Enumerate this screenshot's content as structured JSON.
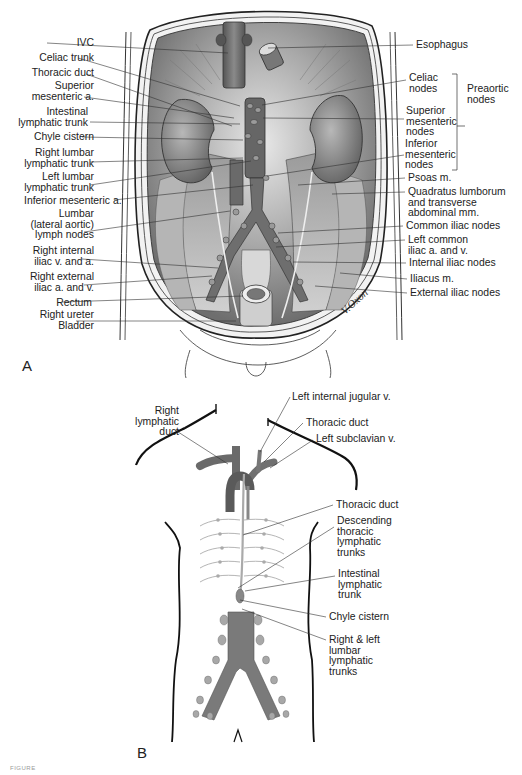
{
  "figure": {
    "panel_a": {
      "letter": "A",
      "x": 22,
      "y": 357
    },
    "panel_b": {
      "letter": "B",
      "x": 137,
      "y": 744
    },
    "signature": "V.Oxon",
    "caption": "FIGURE"
  },
  "panel_a_labels_left": [
    {
      "id": "ivc",
      "text": "IVC",
      "x": 24,
      "y": 38,
      "lx": 47,
      "ly": 43,
      "tx": 228,
      "ty": 53
    },
    {
      "id": "celiac-trunk",
      "text": "Celiac trunk",
      "x": 24,
      "y": 53,
      "lx": 78,
      "ly": 58,
      "tx": 240,
      "ty": 106
    },
    {
      "id": "thoracic-duct",
      "text": "Thoracic duct",
      "x": 24,
      "y": 68,
      "lx": 86,
      "ly": 74,
      "tx": 232,
      "ty": 126
    },
    {
      "id": "superior-mesenteric-a",
      "text": "Superior\nmesenteric a.",
      "x": 24,
      "y": 81,
      "lx": 84,
      "ly": 97,
      "tx": 234,
      "ty": 118
    },
    {
      "id": "intestinal-lymphatic-trunk",
      "text": "Intestinal\nlymphatic trunk",
      "x": 18,
      "y": 107,
      "lx": 90,
      "ly": 122,
      "tx": 240,
      "ty": 124
    },
    {
      "id": "chyle-cistern",
      "text": "Chyle cistern",
      "x": 24,
      "y": 132,
      "lx": 82,
      "ly": 137,
      "tx": 243,
      "ty": 140
    },
    {
      "id": "right-lumbar-lymphatic-trunk",
      "text": "Right lumbar\nlymphatic trunk",
      "x": 24,
      "y": 148,
      "lx": 90,
      "ly": 162,
      "tx": 243,
      "ty": 158
    },
    {
      "id": "left-lumbar-lymphatic-trunk",
      "text": "Left lumbar\nlymphatic trunk",
      "x": 24,
      "y": 172,
      "lx": 90,
      "ly": 185,
      "tx": 251,
      "ty": 161
    },
    {
      "id": "inferior-mesenteric-a",
      "text": "Inferior mesenteric a.",
      "x": 24,
      "y": 196,
      "lx": 114,
      "ly": 200,
      "tx": 253,
      "ty": 185
    },
    {
      "id": "lumbar-lateral-aortic-lymph-nodes",
      "text": "Lumbar\n(lateral aortic)\nlymph nodes",
      "x": 24,
      "y": 209,
      "lx": 84,
      "ly": 232,
      "tx": 230,
      "ty": 211
    },
    {
      "id": "right-internal-iliac-v-and-a",
      "text": "Right internal\niliac v. and a.",
      "x": 24,
      "y": 246,
      "lx": 82,
      "ly": 259,
      "tx": 218,
      "ty": 268
    },
    {
      "id": "right-external-iliac-a-and-v",
      "text": "Right external\niliac a. and v.",
      "x": 24,
      "y": 272,
      "lx": 84,
      "ly": 285,
      "tx": 212,
      "ty": 276
    },
    {
      "id": "rectum",
      "text": "Rectum",
      "x": 22,
      "y": 298,
      "lx": 62,
      "ly": 302,
      "tx": 243,
      "ty": 296
    },
    {
      "id": "right-ureter",
      "text": "Right ureter",
      "x": 24,
      "y": 310,
      "lx": null,
      "ly": null,
      "tx": null,
      "ty": null
    },
    {
      "id": "bladder",
      "text": "Bladder",
      "x": 24,
      "y": 321,
      "lx": 76,
      "ly": 321,
      "tx": 236,
      "ty": 321
    }
  ],
  "panel_a_labels_right": [
    {
      "id": "esophagus",
      "text": "Esophagus",
      "x": 416,
      "y": 40,
      "lx": 413,
      "ly": 45,
      "tx": 268,
      "ty": 48
    },
    {
      "id": "celiac-nodes",
      "text": "Celiac\nnodes",
      "x": 409,
      "y": 73,
      "lx": 406,
      "ly": 80,
      "tx": 262,
      "ty": 105
    },
    {
      "id": "superior-mesenteric-nodes",
      "text": "Superior\nmesenteric\nnodes",
      "x": 406,
      "y": 106,
      "lx": 404,
      "ly": 119,
      "tx": 263,
      "ty": 118
    },
    {
      "id": "inferior-mesenteric-nodes",
      "text": "Inferior\nmesenteric\nnodes",
      "x": 405,
      "y": 139,
      "lx": 404,
      "ly": 155,
      "tx": 267,
      "ty": 176
    },
    {
      "id": "psoas-m",
      "text": "Psoas m.",
      "x": 408,
      "y": 173,
      "lx": 405,
      "ly": 178,
      "tx": 298,
      "ty": 185
    },
    {
      "id": "quadratus-lumborum",
      "text": "Quadratus lumborum\nand transverse\nabdominal mm.",
      "x": 408,
      "y": 187,
      "lx": 405,
      "ly": 192,
      "tx": 332,
      "ty": 194
    },
    {
      "id": "common-iliac-nodes",
      "text": "Common iliac nodes",
      "x": 406,
      "y": 221,
      "lx": 403,
      "ly": 226,
      "tx": 278,
      "ty": 233
    },
    {
      "id": "left-common-iliac-a-and-v",
      "text": "Left common\niliac a. and v.",
      "x": 408,
      "y": 235,
      "lx": 405,
      "ly": 240,
      "tx": 276,
      "ty": 247
    },
    {
      "id": "internal-iliac-nodes",
      "text": "Internal iliac nodes",
      "x": 409,
      "y": 258,
      "lx": 406,
      "ly": 263,
      "tx": 293,
      "ty": 262
    },
    {
      "id": "iliacus-m",
      "text": "Iliacus m.",
      "x": 410,
      "y": 274,
      "lx": 407,
      "ly": 279,
      "tx": 340,
      "ty": 273
    },
    {
      "id": "external-iliac-nodes",
      "text": "External iliac nodes",
      "x": 410,
      "y": 288,
      "lx": 407,
      "ly": 293,
      "tx": 315,
      "ty": 286
    }
  ],
  "panel_a_bracket": {
    "label": "Preaortic\nnodes",
    "x": 467,
    "y": 84,
    "top": 74,
    "bottom": 170,
    "bx": 457
  },
  "panel_b_labels": [
    {
      "id": "right-lymphatic-duct",
      "text": "Right\nlymphatic\nduct",
      "x": 122,
      "y": 406,
      "align": "r",
      "lx": 175,
      "ly": 430,
      "tx": 228,
      "ty": 464
    },
    {
      "id": "left-internal-jugular-v",
      "text": "Left internal jugular v.",
      "x": 292,
      "y": 392,
      "align": "l",
      "lx": 290,
      "ly": 397,
      "tx": 260,
      "ty": 452
    },
    {
      "id": "thoracic-duct-upper",
      "text": "Thoracic duct",
      "x": 306,
      "y": 418,
      "align": "l",
      "lx": 303,
      "ly": 423,
      "tx": 264,
      "ty": 462
    },
    {
      "id": "left-subclavian-v",
      "text": "Left subclavian v.",
      "x": 316,
      "y": 434,
      "align": "l",
      "lx": 313,
      "ly": 440,
      "tx": 270,
      "ty": 468
    },
    {
      "id": "thoracic-duct-mid",
      "text": "Thoracic duct",
      "x": 336,
      "y": 500,
      "align": "l",
      "lx": 333,
      "ly": 505,
      "tx": 243,
      "ty": 535
    },
    {
      "id": "descending-thoracic-lymphatic-trunks",
      "text": "Descending\nthoracic\nlymphatic\ntrunks",
      "x": 337,
      "y": 516,
      "align": "l",
      "lx": 334,
      "ly": 527,
      "tx": 238,
      "ty": 588
    },
    {
      "id": "intestinal-lymphatic-trunk-b",
      "text": "Intestinal\nlymphatic\ntrunk",
      "x": 338,
      "y": 569,
      "align": "l",
      "lx": 335,
      "ly": 576,
      "tx": 245,
      "ty": 591
    },
    {
      "id": "chyle-cistern-b",
      "text": "Chyle cistern",
      "x": 329,
      "y": 612,
      "align": "l",
      "lx": 326,
      "ly": 617,
      "tx": 240,
      "ty": 600
    },
    {
      "id": "right-and-left-lumbar-lymphatic-trunks",
      "text": "Right & left\nlumbar\nlymphatic\ntrunks",
      "x": 329,
      "y": 635,
      "align": "l",
      "lx": 326,
      "ly": 640,
      "tx": 242,
      "ty": 609
    }
  ],
  "colors": {
    "ink": "#222222",
    "organ_dark": "#5a5a5a",
    "organ_mid": "#8c8c8c",
    "organ_light": "#c4c4c4",
    "vessel": "#6a6a6a",
    "node": "#9a9a9a"
  }
}
